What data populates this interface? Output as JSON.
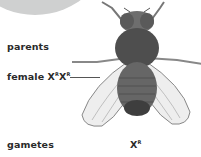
{
  "diagram": {
    "labels": {
      "parents": "parents",
      "female_prefix": "female X",
      "female_sup1": "R",
      "female_mid": "X",
      "female_sup2": "R",
      "gametes": "gametes",
      "gamete_base": "X",
      "gamete_sup": "R"
    },
    "illustration": "fruit-fly (Drosophila) top view",
    "colors": {
      "background": "#ffffff",
      "circle": "#d2d3d3",
      "text": "#2a2a2a"
    }
  }
}
